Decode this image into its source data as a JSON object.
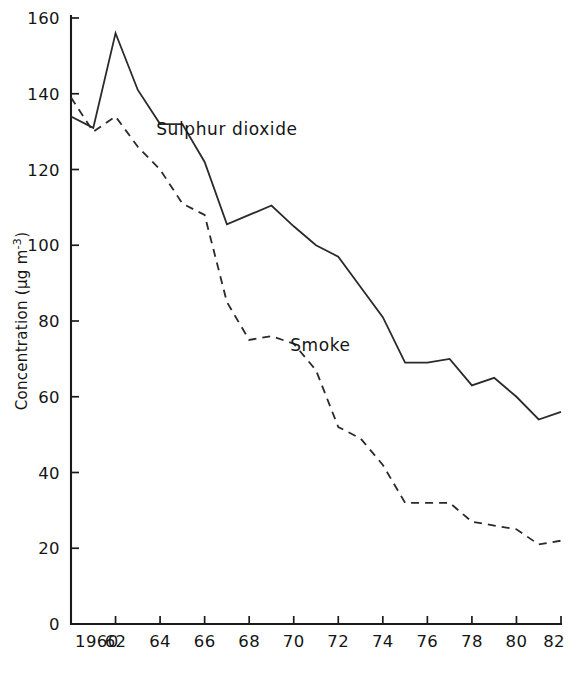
{
  "chart_data": {
    "type": "line",
    "title": "",
    "xlabel": "",
    "ylabel": "Concentration (µg m⁻³)",
    "ylabel_parts": {
      "prefix": "Concentration (µg m",
      "exponent": "-3",
      "suffix": ")"
    },
    "xlim": [
      1960,
      1982
    ],
    "ylim": [
      0,
      160
    ],
    "grid": false,
    "legend_position": "inline-annotations",
    "x_ticks": [
      1960,
      1962,
      1964,
      1966,
      1968,
      1970,
      1972,
      1974,
      1976,
      1978,
      1980,
      1982
    ],
    "x_tick_labels": [
      "1960",
      "62",
      "64",
      "66",
      "68",
      "70",
      "72",
      "74",
      "76",
      "78",
      "80",
      "82"
    ],
    "y_ticks": [
      0,
      20,
      40,
      60,
      80,
      100,
      120,
      140,
      160
    ],
    "y_tick_labels": [
      "0",
      "20",
      "40",
      "60",
      "80",
      "100",
      "120",
      "140",
      "160"
    ],
    "x": [
      1960,
      1961,
      1962,
      1963,
      1964,
      1965,
      1966,
      1967,
      1968,
      1969,
      1970,
      1971,
      1972,
      1973,
      1974,
      1975,
      1976,
      1977,
      1978,
      1979,
      1980,
      1981,
      1982
    ],
    "series": [
      {
        "name": "Sulphur dioxide",
        "style": "solid",
        "color": "#2a2a2a",
        "label_x": 1967,
        "label_y": 129,
        "values": [
          134,
          131,
          156,
          141,
          132,
          132,
          122,
          105.5,
          108,
          110.5,
          105,
          100,
          97,
          89,
          81,
          69,
          69,
          70,
          63,
          65,
          60,
          54,
          56
        ]
      },
      {
        "name": "Smoke",
        "style": "dashed",
        "color": "#2a2a2a",
        "label_x": 1971.2,
        "label_y": 72,
        "values": [
          139,
          130,
          134,
          126,
          120,
          111,
          108,
          85,
          75,
          76,
          74,
          67,
          52,
          49,
          42,
          32,
          32,
          32,
          27,
          26,
          25,
          21,
          22
        ]
      }
    ]
  }
}
